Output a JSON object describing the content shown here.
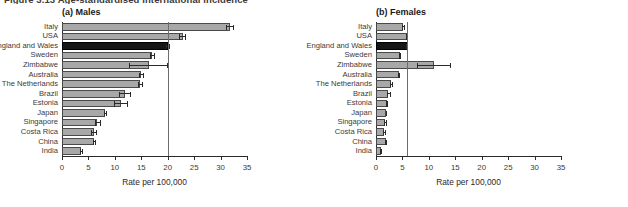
{
  "figure": {
    "caption": "Figure 3.13   Age-standardised international incidence"
  },
  "panels": [
    {
      "id": "males",
      "title": "(a) Males",
      "xlabel": "Rate per 100,000",
      "xticks": [
        "0",
        "5",
        "10",
        "15",
        "20",
        "25",
        "30",
        "35"
      ]
    },
    {
      "id": "females",
      "title": "(b) Females",
      "xlabel": "Rate per 100,000",
      "xticks": [
        "0",
        "5",
        "10",
        "15",
        "20",
        "25",
        "30",
        "35"
      ]
    }
  ],
  "chart_data": [
    {
      "type": "bar",
      "orientation": "horizontal",
      "title": "(a) Males",
      "xlabel": "Rate per 100,000",
      "ylabel": "",
      "xlim": [
        0,
        35
      ],
      "xticks": [
        0,
        5,
        10,
        15,
        20,
        25,
        30,
        35
      ],
      "grid": false,
      "legend": "none",
      "reference_line": 20.0,
      "highlight_category": "England and Wales",
      "categories": [
        "Italy",
        "USA",
        "England and Wales",
        "Sweden",
        "Zimbabwe",
        "Australia",
        "The Netherlands",
        "Brazil",
        "Estonia",
        "Japan",
        "Singapore",
        "Costa Rica",
        "China",
        "India"
      ],
      "values": [
        31.8,
        22.8,
        20.0,
        17.0,
        16.4,
        15.0,
        14.8,
        12.0,
        11.2,
        8.2,
        6.7,
        6.0,
        6.1,
        3.6
      ],
      "error_low": [
        31.1,
        22.2,
        19.6,
        16.6,
        12.7,
        14.6,
        14.4,
        10.8,
        9.8,
        7.9,
        6.3,
        5.5,
        5.8,
        3.4
      ],
      "error_high": [
        32.6,
        23.4,
        20.5,
        17.6,
        20.0,
        15.5,
        15.3,
        13.1,
        12.4,
        8.6,
        7.3,
        6.6,
        6.4,
        3.9
      ]
    },
    {
      "type": "bar",
      "orientation": "horizontal",
      "title": "(b) Females",
      "xlabel": "Rate per 100,000",
      "ylabel": "",
      "xlim": [
        0,
        35
      ],
      "xticks": [
        0,
        5,
        10,
        15,
        20,
        25,
        30,
        35
      ],
      "grid": false,
      "legend": "none",
      "reference_line": 5.8,
      "highlight_category": "England and Wales",
      "categories": [
        "Italy",
        "USA",
        "England and Wales",
        "Sweden",
        "Zimbabwe",
        "Australia",
        "The Netherlands",
        "Brazil",
        "Estonia",
        "Japan",
        "Singapore",
        "Costa Rica",
        "China",
        "India"
      ],
      "values": [
        5.2,
        5.9,
        5.8,
        4.5,
        11.0,
        4.3,
        2.9,
        2.3,
        2.0,
        1.9,
        1.7,
        1.6,
        1.8,
        0.9
      ],
      "error_low": [
        5.0,
        5.7,
        5.6,
        4.3,
        7.8,
        4.1,
        2.7,
        2.0,
        1.8,
        1.8,
        1.5,
        1.4,
        1.7,
        0.8
      ],
      "error_high": [
        5.5,
        6.1,
        6.0,
        4.8,
        14.2,
        4.6,
        3.2,
        2.8,
        2.3,
        2.1,
        2.0,
        1.9,
        2.0,
        1.0
      ]
    }
  ]
}
